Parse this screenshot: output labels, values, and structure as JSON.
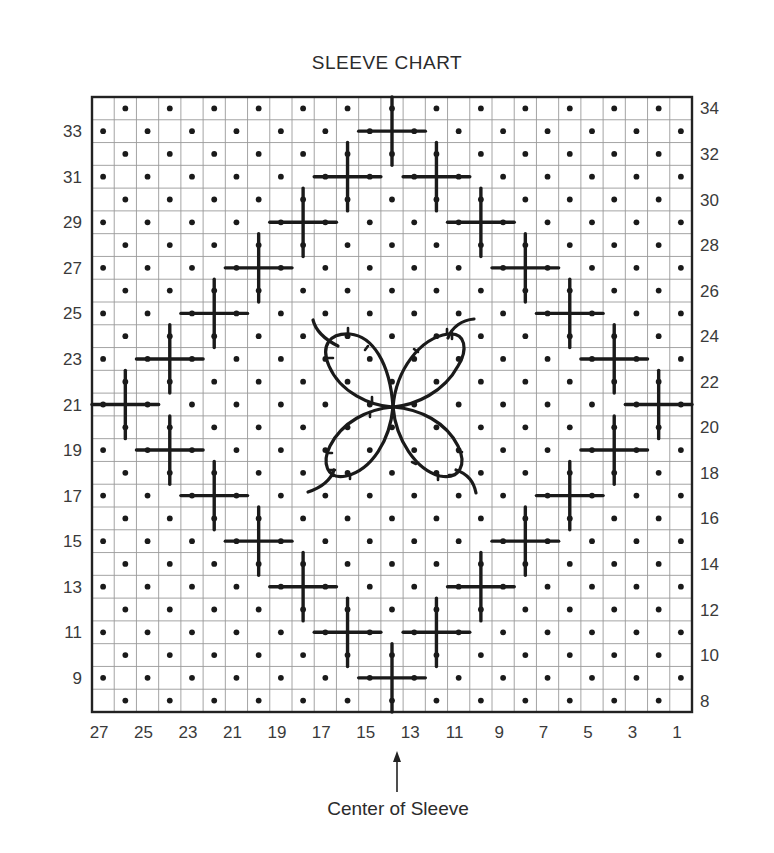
{
  "title": "SLEEVE CHART",
  "caption": "Center of Sleeve",
  "grid": {
    "columns": 27,
    "rows_from": 8,
    "rows_to": 34,
    "left": 92,
    "top": 97,
    "right": 692,
    "bottom": 712,
    "grid_color": "#9a9a9a",
    "border_color": "#222222",
    "ink_color": "#1a1a1a"
  },
  "left_row_labels": [
    "33",
    "31",
    "29",
    "27",
    "25",
    "23",
    "21",
    "19",
    "17",
    "15",
    "13",
    "11",
    "9"
  ],
  "right_row_labels": [
    "34",
    "32",
    "30",
    "28",
    "26",
    "24",
    "22",
    "20",
    "18",
    "16",
    "14",
    "12",
    "10",
    "8"
  ],
  "bottom_column_labels": [
    "27",
    "25",
    "23",
    "21",
    "19",
    "17",
    "15",
    "13",
    "11",
    "9",
    "7",
    "5",
    "3",
    "1"
  ],
  "center_marker": {
    "column": 14,
    "label": "Center of Sleeve"
  },
  "legend_symbols": {
    "dot": "purl stitch (dot)",
    "cross": "cross stitch motif",
    "butterfly": "embroidered butterfly motif"
  },
  "crosses": [
    {
      "col": 14,
      "row": 33
    },
    {
      "col": 16,
      "row": 31
    },
    {
      "col": 12,
      "row": 31
    },
    {
      "col": 18,
      "row": 29
    },
    {
      "col": 10,
      "row": 29
    },
    {
      "col": 20,
      "row": 27
    },
    {
      "col": 8,
      "row": 27
    },
    {
      "col": 22,
      "row": 25
    },
    {
      "col": 6,
      "row": 25
    },
    {
      "col": 24,
      "row": 23
    },
    {
      "col": 4,
      "row": 23
    },
    {
      "col": 26,
      "row": 21
    },
    {
      "col": 2,
      "row": 21
    },
    {
      "col": 24,
      "row": 19
    },
    {
      "col": 4,
      "row": 19
    },
    {
      "col": 22,
      "row": 17
    },
    {
      "col": 6,
      "row": 17
    },
    {
      "col": 20,
      "row": 15
    },
    {
      "col": 8,
      "row": 15
    },
    {
      "col": 18,
      "row": 13
    },
    {
      "col": 10,
      "row": 13
    },
    {
      "col": 16,
      "row": 11
    },
    {
      "col": 12,
      "row": 11
    },
    {
      "col": 14,
      "row": 9
    }
  ]
}
